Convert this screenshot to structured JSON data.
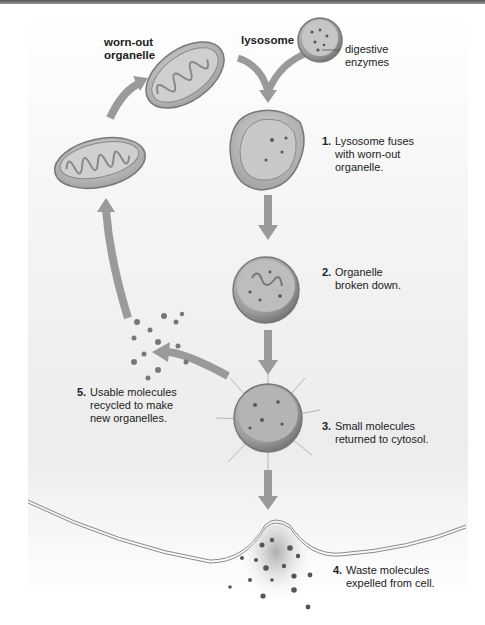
{
  "labels": {
    "worn_out_organelle": [
      "worn-out",
      "organelle"
    ],
    "lysosome": "lysosome",
    "digestive_enzymes": [
      "digestive",
      "enzymes"
    ]
  },
  "steps": [
    {
      "num": "1.",
      "lines": [
        "Lysosome fuses",
        "with worn-out",
        "organelle."
      ]
    },
    {
      "num": "2.",
      "lines": [
        "Organelle",
        "broken down."
      ]
    },
    {
      "num": "3.",
      "lines": [
        "Small molecules",
        "returned to cytosol."
      ]
    },
    {
      "num": "4.",
      "lines": [
        "Waste molecules",
        "expelled from cell."
      ]
    },
    {
      "num": "5.",
      "lines": [
        "Usable molecules",
        "recycled to make",
        "new organelles."
      ]
    }
  ],
  "colors": {
    "arrow": "#9a9a9a",
    "organelle_fill": "#bdbdbd",
    "organelle_stroke": "#777777",
    "membrane": "#8a8a8a",
    "text": "#222222"
  }
}
